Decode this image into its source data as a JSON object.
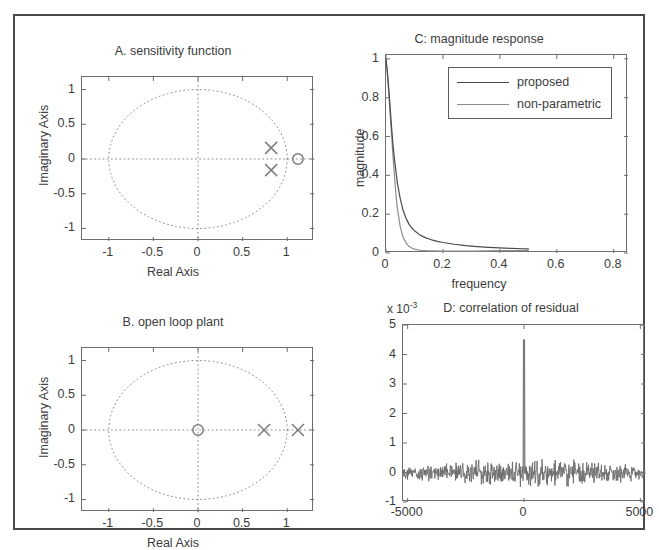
{
  "figure": {
    "background": "#ffffff",
    "frame_color": "#4a4a4a",
    "axis_color": "#6e6e6e",
    "text_color": "#3c3c3c"
  },
  "panels": {
    "A": {
      "title": "A. sensitivity function",
      "xlabel": "Real Axis",
      "ylabel": "Imaginary Axis",
      "xticks": [
        "-1",
        "-0.5",
        "0",
        "0.5",
        "1"
      ],
      "yticks": [
        "1",
        "0.5",
        "0",
        "-0.5",
        "-1"
      ]
    },
    "B": {
      "title": "B. open loop plant",
      "xlabel": "Real Axis",
      "ylabel": "Imaginary Axis",
      "xticks": [
        "-1",
        "-0.5",
        "0",
        "0.5",
        "1"
      ],
      "yticks": [
        "1",
        "0.5",
        "0",
        "-0.5",
        "-1"
      ]
    },
    "C": {
      "title": "C: magnitude response",
      "xlabel": "frequency",
      "ylabel": "magnitude",
      "xticks": [
        "0",
        "0.2",
        "0.4",
        "0.6",
        "0.8"
      ],
      "yticks": [
        "1",
        "0.8",
        "0.6",
        "0.4",
        "0.2",
        "0"
      ],
      "legend": [
        {
          "label": "proposed",
          "color": "#4a4a4a"
        },
        {
          "label": "non-parametric",
          "color": "#8c8c8c"
        }
      ]
    },
    "D": {
      "title": "D: correlation of residual",
      "exponent_prefix": "x 10",
      "exponent_value": "-3",
      "xticks": [
        "-5000",
        "0",
        "5000"
      ],
      "yticks": [
        "5",
        "4",
        "3",
        "2",
        "1",
        "0",
        "-1"
      ]
    }
  },
  "chart_data": [
    {
      "type": "scatter",
      "id": "A",
      "title": "A. sensitivity function",
      "xlabel": "Real Axis",
      "ylabel": "Imaginary Axis",
      "xlim": [
        -1.3,
        1.3
      ],
      "ylim": [
        -1.18,
        1.18
      ],
      "xticks": [
        -1,
        -0.5,
        0,
        0.5,
        1
      ],
      "yticks": [
        -1,
        -0.5,
        0,
        0.5,
        1
      ],
      "grid": "dotted",
      "unit_circle": true,
      "series": [
        {
          "name": "poles",
          "marker": "x",
          "color": "#7d7d7d",
          "points": [
            [
              0.82,
              0.16
            ],
            [
              0.82,
              -0.16
            ]
          ]
        },
        {
          "name": "zeros",
          "marker": "o",
          "color": "#7d7d7d",
          "points": [
            [
              1.12,
              0.0
            ]
          ]
        }
      ]
    },
    {
      "type": "scatter",
      "id": "B",
      "title": "B. open loop plant",
      "xlabel": "Real Axis",
      "ylabel": "Imaginary Axis",
      "xlim": [
        -1.3,
        1.3
      ],
      "ylim": [
        -1.18,
        1.18
      ],
      "xticks": [
        -1,
        -0.5,
        0,
        0.5,
        1
      ],
      "yticks": [
        -1,
        -0.5,
        0,
        0.5,
        1
      ],
      "grid": "dotted",
      "unit_circle": true,
      "series": [
        {
          "name": "poles",
          "marker": "x",
          "color": "#7d7d7d",
          "points": [
            [
              0.74,
              0.0
            ],
            [
              1.12,
              0.0
            ]
          ]
        },
        {
          "name": "zeros",
          "marker": "o",
          "color": "#7d7d7d",
          "points": [
            [
              0.0,
              0.0
            ]
          ]
        }
      ]
    },
    {
      "type": "line",
      "id": "C",
      "title": "C: magnitude response",
      "xlabel": "frequency",
      "ylabel": "magnitude",
      "xlim": [
        0,
        0.85
      ],
      "ylim": [
        0,
        1.02
      ],
      "xticks": [
        0,
        0.2,
        0.4,
        0.6,
        0.8
      ],
      "yticks": [
        0,
        0.2,
        0.4,
        0.6,
        0.8,
        1
      ],
      "legend_position": "top-right-inside",
      "series": [
        {
          "name": "proposed",
          "color": "#4a4a4a",
          "x": [
            0.0,
            0.005,
            0.01,
            0.015,
            0.02,
            0.025,
            0.03,
            0.04,
            0.05,
            0.06,
            0.07,
            0.08,
            0.09,
            0.1,
            0.12,
            0.14,
            0.16,
            0.18,
            0.2,
            0.24,
            0.28,
            0.32,
            0.36,
            0.4,
            0.44,
            0.48,
            0.5
          ],
          "y": [
            1.0,
            0.93,
            0.84,
            0.74,
            0.64,
            0.55,
            0.48,
            0.36,
            0.28,
            0.22,
            0.18,
            0.15,
            0.13,
            0.115,
            0.092,
            0.078,
            0.068,
            0.06,
            0.054,
            0.045,
            0.038,
            0.033,
            0.029,
            0.026,
            0.024,
            0.022,
            0.021
          ]
        },
        {
          "name": "non-parametric",
          "color": "#8c8c8c",
          "x": [
            0.0,
            0.005,
            0.01,
            0.015,
            0.02,
            0.025,
            0.03,
            0.035,
            0.04,
            0.05,
            0.06,
            0.07,
            0.08,
            0.09,
            0.1,
            0.12,
            0.14,
            0.16,
            0.2,
            0.25,
            0.3,
            0.35,
            0.4,
            0.45,
            0.5
          ],
          "y": [
            1.0,
            0.92,
            0.82,
            0.71,
            0.6,
            0.49,
            0.39,
            0.3,
            0.23,
            0.135,
            0.082,
            0.052,
            0.035,
            0.026,
            0.02,
            0.014,
            0.012,
            0.011,
            0.01,
            0.01,
            0.01,
            0.011,
            0.012,
            0.013,
            0.014
          ]
        }
      ]
    },
    {
      "type": "line",
      "id": "D",
      "title": "D: correlation of residual",
      "xlabel": "",
      "ylabel": "",
      "y_scale_exponent": -3,
      "xlim": [
        -5200,
        5200
      ],
      "ylim": [
        -1,
        5
      ],
      "xticks": [
        -5000,
        0,
        5000
      ],
      "yticks": [
        -1,
        0,
        1,
        2,
        3,
        4,
        5
      ],
      "series": [
        {
          "name": "residual autocorrelation",
          "color": "#6b6b6b",
          "peak_lag": 0,
          "peak_value": 4.5,
          "noise_band_amplitude": 0.35,
          "noise_band_center": 0.0
        }
      ]
    }
  ]
}
